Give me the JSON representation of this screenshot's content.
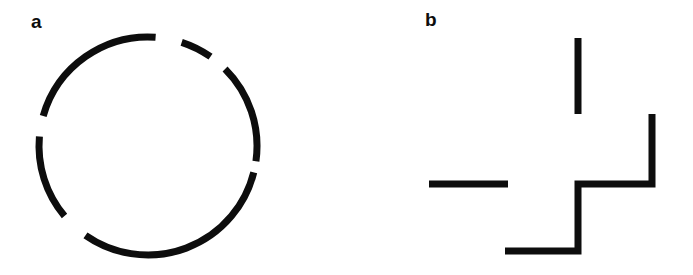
{
  "figure": {
    "background_color": "#ffffff",
    "stroke_color": "#0d0d0d",
    "width": 693,
    "height": 275,
    "panels": [
      {
        "id": "a",
        "label": "a",
        "label_x": 31,
        "label_y": 12,
        "shape": "fragmented-circle",
        "description": "Circle outline interrupted by five white gaps",
        "circle": {
          "center_x": 148,
          "center_y": 146,
          "radius": 109,
          "stroke_width": 7
        },
        "arcs": [
          {
            "name": "arc-top-left",
            "start_deg": 196,
            "end_deg": 274
          },
          {
            "name": "arc-top",
            "start_deg": 288,
            "end_deg": 305
          },
          {
            "name": "arc-upper-right",
            "start_deg": 315,
            "end_deg": 8
          },
          {
            "name": "arc-right-bottom",
            "start_deg": 14,
            "end_deg": 125
          },
          {
            "name": "arc-bottom-left",
            "start_deg": 140,
            "end_deg": 185
          }
        ],
        "gaps": [
          {
            "name": "gap-top",
            "start_deg": 274,
            "end_deg": 288
          },
          {
            "name": "gap-upper-right",
            "start_deg": 305,
            "end_deg": 315
          },
          {
            "name": "gap-right",
            "start_deg": 8,
            "end_deg": 14
          },
          {
            "name": "gap-bottom-left",
            "start_deg": 125,
            "end_deg": 140
          },
          {
            "name": "gap-left",
            "start_deg": 185,
            "end_deg": 196
          }
        ]
      },
      {
        "id": "b",
        "label": "b",
        "label_x": 78,
        "label_y": 10,
        "shape": "fragmented-staircase",
        "description": "Isolated vertical bar, isolated horizontal bar and a stepped polyline",
        "stroke_width": 7,
        "segments": [
          {
            "name": "vertical-bar-top",
            "type": "line",
            "x1": 231,
            "y1": 38,
            "x2": 231,
            "y2": 114
          },
          {
            "name": "horizontal-bar-left",
            "type": "line",
            "x1": 82,
            "y1": 184,
            "x2": 161,
            "y2": 184
          },
          {
            "name": "staircase-polyline",
            "type": "polyline",
            "points": "305,114 305,184 231,184 231,251 158,251"
          }
        ]
      }
    ]
  }
}
